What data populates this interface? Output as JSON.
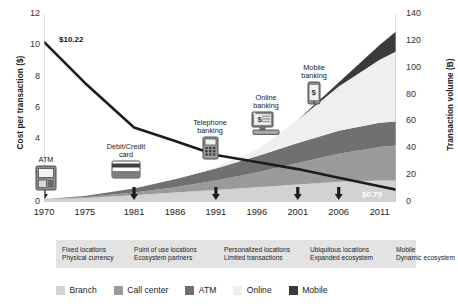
{
  "chart_data": {
    "type": "area",
    "title": "",
    "xlabel": "",
    "ylabel": "Cost per transaction ($)",
    "ylabel_right": "Transaction volume (B)",
    "ylim": [
      0,
      12
    ],
    "ylim_right": [
      0,
      140
    ],
    "xlim": [
      1970,
      2013
    ],
    "grid": false,
    "legend_position": "bottom",
    "x_ticks": [
      "1970",
      "1975",
      "1981",
      "1986",
      "1991",
      "1996",
      "2001",
      "2006",
      "2011"
    ],
    "x_tick_values": [
      1970,
      1975,
      1981,
      1986,
      1991,
      1996,
      2001,
      2006,
      2011
    ],
    "y_ticks_left": [
      "0",
      "2",
      "4",
      "6",
      "8",
      "10",
      "12"
    ],
    "y_tick_values_left": [
      0,
      2,
      4,
      6,
      8,
      10,
      12
    ],
    "y_ticks_right": [
      "0",
      "20",
      "40",
      "60",
      "80",
      "100",
      "120",
      "140"
    ],
    "y_tick_values_right": [
      0,
      20,
      40,
      60,
      80,
      100,
      120,
      140
    ],
    "x": [
      1970,
      1975,
      1981,
      1986,
      1991,
      1996,
      2001,
      2006,
      2011,
      2013
    ],
    "series": [
      {
        "name": "Branch",
        "kind": "stacked-area",
        "axis": "right",
        "color": "#d2d2d2",
        "values": [
          2.0,
          3.0,
          5.0,
          7.0,
          9.0,
          11.0,
          13.0,
          15.0,
          16.0,
          16.0
        ]
      },
      {
        "name": "Call center",
        "kind": "stacked-area",
        "axis": "right",
        "color": "#9a9a9a",
        "values": [
          0.0,
          0.5,
          2.0,
          4.0,
          7.0,
          11.0,
          16.0,
          21.0,
          25.0,
          26.0
        ]
      },
      {
        "name": "ATM",
        "kind": "stacked-area",
        "axis": "right",
        "color": "#707070",
        "values": [
          0.0,
          1.0,
          3.0,
          6.0,
          9.0,
          12.0,
          15.0,
          17.0,
          18.0,
          18.0
        ]
      },
      {
        "name": "Online",
        "kind": "stacked-area",
        "axis": "right",
        "color": "#efefef",
        "values": [
          0.0,
          0.0,
          0.0,
          0.0,
          1.0,
          5.0,
          17.0,
          33.0,
          47.0,
          52.0
        ]
      },
      {
        "name": "Mobile",
        "kind": "stacked-area",
        "axis": "right",
        "color": "#3a3a3a",
        "values": [
          0.0,
          0.0,
          0.0,
          0.0,
          0.0,
          0.0,
          0.0,
          3.0,
          11.0,
          15.0
        ]
      },
      {
        "name": "Cost per transaction",
        "kind": "line",
        "axis": "left",
        "color": "#1c1c1c",
        "values": [
          10.22,
          7.6,
          4.75,
          3.9,
          3.0,
          2.55,
          2.1,
          1.55,
          1.0,
          0.79
        ]
      }
    ],
    "annotations": [
      {
        "label": "ATM",
        "year": 1970,
        "icon": "atm-machine-icon"
      },
      {
        "label": "Debit/Credit\ncard",
        "year": 1981,
        "icon": "credit-card-icon"
      },
      {
        "label": "Telephone\nbanking",
        "year": 1991,
        "icon": "telephone-icon"
      },
      {
        "label": "Online\nbanking",
        "year": 2001,
        "icon": "desktop-computer-icon"
      },
      {
        "label": "Mobile\nbanking",
        "year": 2006,
        "icon": "mobile-phone-icon"
      }
    ],
    "data_labels": [
      {
        "name": "start-value",
        "text": "$10.22",
        "year": 1970,
        "value": 10.22
      },
      {
        "name": "end-value",
        "text": "$0.79",
        "year": 2013,
        "value": 0.79
      }
    ],
    "markers": {
      "name": "milestone-arrows",
      "years": [
        1970,
        1981,
        1991,
        2001,
        2006
      ]
    },
    "legend": [
      {
        "label": "Branch",
        "color": "#d2d2d2"
      },
      {
        "label": "Call center",
        "color": "#9a9a9a"
      },
      {
        "label": "ATM",
        "color": "#707070"
      },
      {
        "label": "Online",
        "color": "#efefef"
      },
      {
        "label": "Mobile",
        "color": "#3a3a3a"
      }
    ],
    "caption_band": {
      "background": "#e3e3e3",
      "groups": [
        {
          "line1": "Fixed locations",
          "line2": "Physical currency"
        },
        {
          "line1": "Point of use locations",
          "line2": "Ecosystem partners"
        },
        {
          "line1": "Personalized locations",
          "line2": "Limited transactions"
        },
        {
          "line1": "Ubiquitous locations",
          "line2": "Expanded ecosystem"
        },
        {
          "line1": "Mobile",
          "line2": "Dynamic ecosystem"
        }
      ]
    }
  }
}
